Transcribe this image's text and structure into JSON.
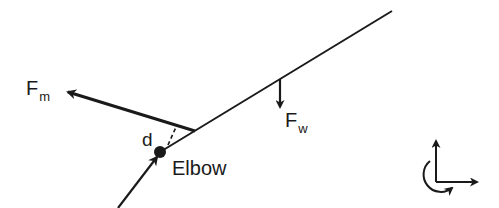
{
  "diagram": {
    "type": "free-body diagram",
    "colors": {
      "ink": "#1a1a1a",
      "background": "#ffffff"
    },
    "labels": {
      "muscle_force": {
        "main": "F",
        "sub": "m"
      },
      "weight_force": {
        "main": "F",
        "sub": "w"
      },
      "moment_arm": "d",
      "joint": "Elbow"
    },
    "elements": [
      {
        "name": "forearm-line",
        "from": [
          160,
          152
        ],
        "to": [
          392,
          11
        ]
      },
      {
        "name": "upper-arm-arrow",
        "from": [
          118,
          208
        ],
        "to": [
          158,
          156
        ]
      },
      {
        "name": "muscle-force-arrow",
        "from": [
          195,
          131
        ],
        "to": [
          67,
          92
        ]
      },
      {
        "name": "weight-force-arrow",
        "from": [
          280,
          79
        ],
        "to": [
          280,
          107
        ]
      },
      {
        "name": "moment-arm-dashed-line",
        "from": [
          168,
          145
        ],
        "to": [
          176,
          127
        ]
      },
      {
        "name": "elbow-joint-dot",
        "center": [
          160,
          152
        ],
        "radius": 6
      }
    ],
    "coordinate_icon": {
      "origin": [
        436,
        182
      ],
      "axes": [
        "y-up",
        "x-right"
      ],
      "rotation": "counterclockwise arc"
    }
  }
}
